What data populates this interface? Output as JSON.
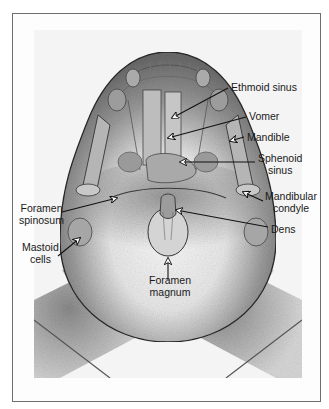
{
  "figure": {
    "view": "Submentovertex radiograph of skull",
    "colors": {
      "frame": "#6e6e6e",
      "arrow": "#111111",
      "label": "#1a1a1a",
      "film_dark": "#4a4a4a",
      "film_light": "#f2f2f2"
    }
  },
  "labels": [
    {
      "id": "ethmoid-sinus",
      "lines": [
        "Ethmoid sinus"
      ]
    },
    {
      "id": "vomer",
      "lines": [
        "Vomer"
      ]
    },
    {
      "id": "mandible",
      "lines": [
        "Mandible"
      ]
    },
    {
      "id": "sphenoid-sinus",
      "lines": [
        "Sphenoid",
        "sinus"
      ]
    },
    {
      "id": "mandibular-condyle",
      "lines": [
        "Mandibular",
        "condyle"
      ]
    },
    {
      "id": "foramen-spinosum",
      "lines": [
        "Foramen",
        "spinosum"
      ]
    },
    {
      "id": "dens",
      "lines": [
        "Dens"
      ]
    },
    {
      "id": "mastoid-cells",
      "lines": [
        "Mastoid",
        "cells"
      ]
    },
    {
      "id": "foramen-magnum",
      "lines": [
        "Foramen",
        "magnum"
      ]
    }
  ]
}
